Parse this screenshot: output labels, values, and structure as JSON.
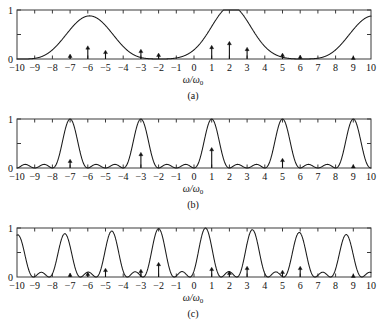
{
  "figure": {
    "panels": [
      {
        "id": "a",
        "caption": "(a)",
        "xlabel_main": "ω/ω",
        "xlabel_sub": "0",
        "ylabel_ticks": [
          "0",
          "1"
        ]
      },
      {
        "id": "b",
        "caption": "(b)",
        "xlabel_main": "ω/ω",
        "xlabel_sub": "0",
        "ylabel_ticks": [
          "0",
          "1"
        ]
      },
      {
        "id": "c",
        "caption": "(c)",
        "xlabel_main": "ω/ω",
        "xlabel_sub": "0",
        "ylabel_ticks": [
          "0",
          "1"
        ]
      }
    ],
    "xtick_labels": [
      "−10",
      "−9",
      "−8",
      "−7",
      "−6",
      "−5",
      "−4",
      "−3",
      "−2",
      "−1",
      "0",
      "1",
      "2",
      "3",
      "4",
      "5",
      "6",
      "7",
      "8",
      "9",
      "10"
    ],
    "colors": {
      "curve": "#1a1a1a",
      "axis": "#3a3a3a",
      "arrow": "#111111",
      "background": "#ffffff"
    }
  },
  "chart_data": [
    {
      "type": "line",
      "panel": "a",
      "title": "",
      "xlabel": "ω/ω0",
      "ylabel": "",
      "xlim": [
        -10,
        10
      ],
      "ylim": [
        0,
        1
      ],
      "xticks": [
        -10,
        -9,
        -8,
        -7,
        -6,
        -5,
        -4,
        -3,
        -2,
        -1,
        0,
        1,
        2,
        3,
        4,
        5,
        6,
        7,
        8,
        9,
        10
      ],
      "yticks": [
        0,
        0.5,
        1
      ],
      "ytick_labels": [
        "0",
        "",
        "1"
      ],
      "grid": false,
      "legend": null,
      "description": "Squared sinc-type interference envelope, principal maxima spaced 8 units apart",
      "envelope": {
        "form": "sinc_squared_modulated",
        "principal_maxima_x": [
          -6.0,
          2.1,
          10.0
        ],
        "principal_maxima_y": [
          1.0,
          1.0,
          1.0
        ],
        "secondary_maxima_x": [
          -9.5,
          -3.0,
          -0.5,
          5.3,
          7.5
        ],
        "secondary_maxima_y": [
          0.09,
          0.57,
          0.07,
          0.57,
          0.07
        ],
        "zeros_x": [
          -10.3,
          -8.7,
          -8.0,
          -4.0,
          -1.6,
          0.0,
          4.0,
          6.6,
          8.2
        ],
        "left_edge_value": 0.45
      },
      "series": [
        {
          "name": "intensity",
          "x": [
            -10,
            -9.5,
            -9,
            -8.5,
            -8,
            -7.5,
            -7,
            -6.5,
            -6,
            -5.5,
            -5,
            -4.5,
            -4,
            -3.5,
            -3,
            -2.5,
            -2,
            -1.5,
            -1,
            -0.5,
            0,
            0.5,
            1,
            1.5,
            2,
            2.5,
            3,
            3.5,
            4,
            4.5,
            5,
            5.5,
            6,
            6.5,
            7,
            7.5,
            8,
            8.5,
            9,
            9.5,
            10
          ],
          "values": [
            0.45,
            0.09,
            0.02,
            0.05,
            0.0,
            0.3,
            0.72,
            0.96,
            1.0,
            0.93,
            0.63,
            0.24,
            0.0,
            0.4,
            0.57,
            0.4,
            0.1,
            0.0,
            0.05,
            0.07,
            0.0,
            0.18,
            0.55,
            0.9,
            1.0,
            0.92,
            0.6,
            0.22,
            0.0,
            0.36,
            0.55,
            0.57,
            0.33,
            0.08,
            0.0,
            0.07,
            0.02,
            0.2,
            0.55,
            0.85,
            1.0
          ]
        }
      ],
      "arrows": {
        "description": "Delta-function spectral lines at integer positions",
        "x": [
          -7,
          -6,
          -5,
          -3,
          -2,
          1,
          2,
          3,
          5,
          6,
          9
        ],
        "heights": [
          0.1,
          0.27,
          0.18,
          0.2,
          0.12,
          0.28,
          0.36,
          0.24,
          0.12,
          0.08,
          0.06
        ]
      }
    },
    {
      "type": "line",
      "panel": "b",
      "title": "",
      "xlabel": "ω/ω0",
      "ylabel": "",
      "xlim": [
        -10,
        10
      ],
      "ylim": [
        0,
        1
      ],
      "xticks": [
        -10,
        -9,
        -8,
        -7,
        -6,
        -5,
        -4,
        -3,
        -2,
        -1,
        0,
        1,
        2,
        3,
        4,
        5,
        6,
        7,
        8,
        9,
        10
      ],
      "yticks": [
        0,
        0.5,
        1
      ],
      "ytick_labels": [
        "0",
        "",
        "1"
      ],
      "grid": false,
      "legend": null,
      "description": "Interference pattern with principal maxima spaced 4 units apart and small subsidiary lobes between",
      "envelope": {
        "form": "multi_slit_interference",
        "principal_maxima_x": [
          -7.0,
          -3.0,
          1.0,
          5.0,
          9.0
        ],
        "principal_maxima_y": [
          1.0,
          1.0,
          1.0,
          1.0,
          1.0
        ],
        "secondary_maxima_x": [
          -9.5,
          -8.5,
          -5.5,
          -4.5,
          -1.5,
          -0.5,
          2.5,
          3.5,
          6.5,
          7.5
        ],
        "secondary_maxima_y": [
          0.28,
          0.28,
          0.26,
          0.26,
          0.26,
          0.26,
          0.26,
          0.26,
          0.26,
          0.26
        ],
        "zeros_x": [
          -10,
          -9,
          -8,
          -6,
          -5,
          -4,
          -2,
          -1,
          0,
          2,
          3,
          4,
          6,
          7,
          8,
          10
        ]
      },
      "series": [
        {
          "name": "intensity",
          "x": [
            -10,
            -9.5,
            -9,
            -8.5,
            -8,
            -7.5,
            -7,
            -6.5,
            -6,
            -5.5,
            -5,
            -4.5,
            -4,
            -3.5,
            -3,
            -2.5,
            -2,
            -1.5,
            -1,
            -0.5,
            0,
            0.5,
            1,
            1.5,
            2,
            2.5,
            3,
            3.5,
            4,
            4.5,
            5,
            5.5,
            6,
            6.5,
            7,
            7.5,
            8,
            8.5,
            9,
            9.5,
            10
          ],
          "values": [
            0.0,
            0.28,
            0.0,
            0.28,
            0.0,
            0.62,
            1.0,
            0.62,
            0.0,
            0.26,
            0.0,
            0.26,
            0.0,
            0.62,
            1.0,
            0.62,
            0.0,
            0.26,
            0.0,
            0.26,
            0.0,
            0.62,
            1.0,
            0.62,
            0.0,
            0.26,
            0.0,
            0.26,
            0.0,
            0.62,
            1.0,
            0.62,
            0.0,
            0.26,
            0.0,
            0.26,
            0.0,
            0.62,
            1.0,
            0.62,
            0.0
          ]
        }
      ],
      "arrows": {
        "description": "Delta-function spectral lines at integer positions",
        "x": [
          -7,
          -3,
          1,
          5,
          9
        ],
        "heights": [
          0.18,
          0.32,
          0.42,
          0.2,
          0.07
        ]
      }
    },
    {
      "type": "line",
      "panel": "c",
      "title": "",
      "xlabel": "ω/ω0",
      "ylabel": "",
      "xlim": [
        -10,
        10
      ],
      "ylim": [
        0,
        1
      ],
      "xticks": [
        -10,
        -9,
        -8,
        -7,
        -6,
        -5,
        -4,
        -3,
        -2,
        -1,
        0,
        1,
        2,
        3,
        4,
        5,
        6,
        7,
        8,
        9,
        10
      ],
      "yticks": [
        0,
        0.5,
        1
      ],
      "ytick_labels": [
        "0",
        "",
        "1"
      ],
      "grid": false,
      "legend": null,
      "description": "Denser interference pattern, principal maxima spaced about 2.7 units apart with intermediate secondary peaks near 0.57",
      "envelope": {
        "form": "multi_slit_interference_dense",
        "principal_maxima_x": [
          -10.0,
          -7.35,
          -5.0,
          -2.4,
          0.65,
          3.3,
          6.0,
          8.65
        ],
        "principal_maxima_y": [
          1.0,
          1.0,
          1.0,
          1.0,
          1.0,
          1.0,
          1.0,
          1.0
        ],
        "secondary_maxima_x": [
          -8.6,
          -6.1,
          -3.6,
          -1.1,
          2.0,
          4.6,
          7.3
        ],
        "secondary_maxima_y": [
          0.55,
          0.57,
          0.57,
          0.57,
          0.5,
          0.55,
          0.55
        ],
        "zeros_x": [
          -9.3,
          -8.0,
          -6.7,
          -5.6,
          -4.3,
          -3.0,
          -1.7,
          1.6,
          2.6,
          4.2,
          5.2,
          6.9,
          7.9,
          9.4
        ]
      },
      "series": [
        {
          "name": "intensity",
          "x": [
            -10,
            -9.5,
            -9,
            -8.5,
            -8,
            -7.5,
            -7,
            -6.5,
            -6,
            -5.5,
            -5,
            -4.5,
            -4,
            -3.5,
            -3,
            -2.5,
            -2,
            -1.5,
            -1,
            -0.5,
            0,
            0.5,
            1,
            1.5,
            2,
            2.5,
            3,
            3.5,
            4,
            4.5,
            5,
            5.5,
            6,
            6.5,
            7,
            7.5,
            8,
            8.5,
            9,
            9.5,
            10
          ],
          "values": [
            1.0,
            0.1,
            0.05,
            0.52,
            0.0,
            0.9,
            0.86,
            0.12,
            0.55,
            0.3,
            1.0,
            0.3,
            0.1,
            0.55,
            0.0,
            0.7,
            0.98,
            0.35,
            0.45,
            0.5,
            0.85,
            1.0,
            0.5,
            0.05,
            0.45,
            0.1,
            0.6,
            1.0,
            0.3,
            0.35,
            0.12,
            0.75,
            1.0,
            0.45,
            0.05,
            0.5,
            0.3,
            0.95,
            0.6,
            0.05,
            0.45
          ]
        }
      ],
      "arrows": {
        "description": "Delta-function spectral lines at integer positions",
        "x": [
          -7,
          -6,
          -5,
          -3,
          -2,
          1,
          2,
          3,
          5,
          6,
          9
        ],
        "heights": [
          0.08,
          0.1,
          0.18,
          0.16,
          0.3,
          0.2,
          0.12,
          0.22,
          0.14,
          0.22,
          0.06
        ]
      }
    }
  ]
}
